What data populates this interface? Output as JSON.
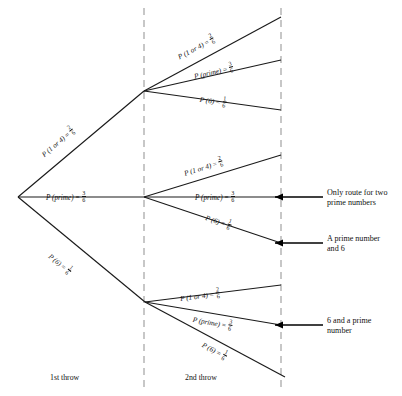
{
  "diagram": {
    "colors": {
      "branch": "#1a1a1a",
      "divider": "#9a9a9a",
      "arrow": "#000000",
      "background": "#ffffff"
    },
    "stage_labels": [
      {
        "text": "1st throw"
      },
      {
        "text": "2nd throw"
      }
    ],
    "branch_labels": {
      "stage1": [
        {
          "event": "P (1 or 4)",
          "numerator": "2",
          "denominator": "6"
        },
        {
          "event": "P (prime)",
          "numerator": "3",
          "denominator": "6"
        },
        {
          "event": "P (6)",
          "numerator": "1",
          "denominator": "6"
        }
      ],
      "stage2_top": [
        {
          "event": "P (1 or 4)",
          "numerator": "2",
          "denominator": "6"
        },
        {
          "event": "P (prime)",
          "numerator": "3",
          "denominator": "6"
        },
        {
          "event": "P (6)",
          "numerator": "1",
          "denominator": "6"
        }
      ],
      "stage2_middle": [
        {
          "event": "P (1 or 4)",
          "numerator": "2",
          "denominator": "6"
        },
        {
          "event": "P (prime)",
          "numerator": "3",
          "denominator": "6"
        },
        {
          "event": "P (6)",
          "numerator": "1",
          "denominator": "6"
        }
      ],
      "stage2_bottom": [
        {
          "event": "P (1 or 4)",
          "numerator": "2",
          "denominator": "6"
        },
        {
          "event": "P (prime)",
          "numerator": "3",
          "denominator": "6"
        },
        {
          "event": "P (6)",
          "numerator": "1",
          "denominator": "6"
        }
      ]
    },
    "callouts": [
      {
        "line1": "Only route for two",
        "line2": "prime numbers"
      },
      {
        "line1": "A prime number",
        "line2": "and 6"
      },
      {
        "line1": "6 and a prime",
        "line2": "number"
      }
    ]
  }
}
